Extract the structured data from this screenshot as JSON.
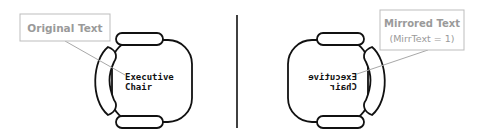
{
  "diagram": {
    "left": {
      "callout": {
        "label": "Original Text"
      },
      "chair_label": {
        "line1": "Executive",
        "line2": "Chair"
      }
    },
    "right": {
      "callout": {
        "label": "Mirrored Text",
        "sublabel": "(MirrText = 1)"
      },
      "chair_label": {
        "line1": "Executive",
        "line2": "Chair"
      }
    },
    "colors": {
      "stroke": "#111111",
      "callout_border": "#bdbdbd",
      "callout_text": "#9a9a9a",
      "leader_line": "#a8a8a8",
      "divider": "#111111"
    }
  }
}
